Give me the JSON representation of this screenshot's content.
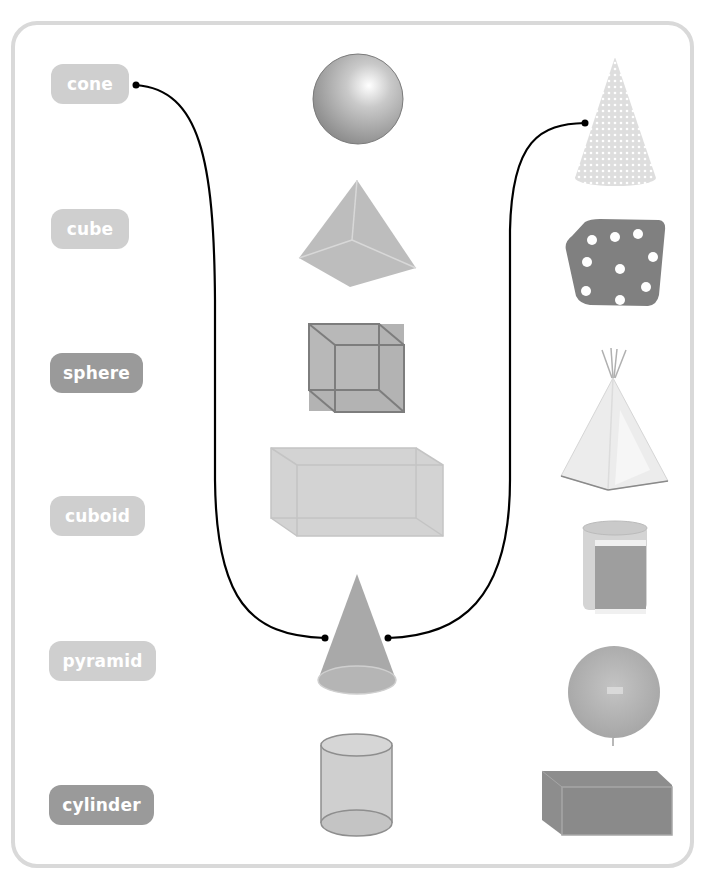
{
  "labels": [
    {
      "text": "cone",
      "style": "light"
    },
    {
      "text": "cube",
      "style": "light"
    },
    {
      "text": "sphere",
      "style": "dark"
    },
    {
      "text": "cuboid",
      "style": "light"
    },
    {
      "text": "pyramid",
      "style": "light"
    },
    {
      "text": "cylinder",
      "style": "dark"
    }
  ],
  "middle_shapes": [
    "sphere",
    "pyramid",
    "cube",
    "cuboid",
    "cone",
    "cylinder"
  ],
  "right_objects": [
    "party-hat-cone",
    "dice-cube",
    "teepee-tent-pyramid",
    "rolled-mat-cylinder",
    "balloon-sphere",
    "box-cuboid"
  ],
  "connections": [
    {
      "from": "label-cone",
      "to": "middle-cone"
    },
    {
      "from": "middle-cone",
      "to": "right-party-hat"
    }
  ],
  "colors": {
    "frame": "#d9d9d9",
    "label_light": "#cfcfcf",
    "label_dark": "#9a9a9a",
    "line": "#000000"
  }
}
